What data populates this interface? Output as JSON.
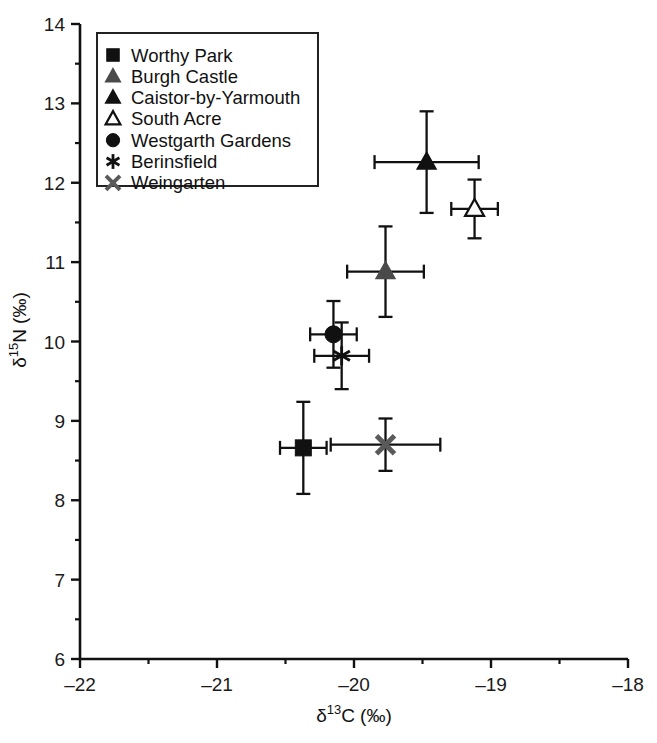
{
  "chart_data": {
    "type": "scatter",
    "title": "",
    "xlabel": "δ13C (‰)",
    "ylabel": "δ15N (‰)",
    "xlabel_parts": {
      "delta": "δ",
      "sup": "13",
      "element": "C",
      "units": "(‰)"
    },
    "ylabel_parts": {
      "delta": "δ",
      "sup": "15",
      "element": "N",
      "units": "(‰)"
    },
    "xlim": [
      -22,
      -18
    ],
    "ylim": [
      6,
      14
    ],
    "x_ticks": [
      -22,
      -21,
      -20,
      -19,
      -18
    ],
    "x_tick_labels": [
      "–22",
      "–21",
      "–20",
      "–19",
      "–18"
    ],
    "y_ticks": [
      6,
      7,
      8,
      9,
      10,
      11,
      12,
      13,
      14
    ],
    "y_tick_labels": [
      "6",
      "7",
      "8",
      "9",
      "10",
      "11",
      "12",
      "13",
      "14"
    ],
    "x_minor_step": 0.5,
    "y_minor_step": 0.5,
    "grid": false,
    "legend_position": "top-left",
    "error_bars": "both",
    "series": [
      {
        "name": "Worthy Park",
        "marker": "square",
        "fill": "#111111",
        "x": -20.37,
        "y": 8.66,
        "xerr": 0.17,
        "yerr": 0.58
      },
      {
        "name": "Burgh Castle",
        "marker": "triangle",
        "fill": "#4a4a4a",
        "x": -19.77,
        "y": 10.88,
        "xerr": 0.28,
        "yerr": 0.57
      },
      {
        "name": "Caistor-by-Yarmouth",
        "marker": "triangle",
        "fill": "#111111",
        "x": -19.47,
        "y": 12.26,
        "xerr": 0.38,
        "yerr": 0.64
      },
      {
        "name": "South Acre",
        "marker": "triangle-open",
        "fill": "#ffffff",
        "x": -19.12,
        "y": 11.67,
        "xerr": 0.17,
        "yerr": 0.37
      },
      {
        "name": "Westgarth Gardens",
        "marker": "circle",
        "fill": "#111111",
        "x": -20.15,
        "y": 10.09,
        "xerr": 0.17,
        "yerr": 0.42
      },
      {
        "name": "Berinsfield",
        "marker": "asterisk",
        "fill": "#111111",
        "x": -20.09,
        "y": 9.82,
        "xerr": 0.2,
        "yerr": 0.42
      },
      {
        "name": "Weingarten",
        "marker": "x-cross",
        "fill": "#5a5a5a",
        "x": -19.77,
        "y": 8.7,
        "xerr": 0.4,
        "yerr": 0.33
      }
    ]
  },
  "legend": {
    "items": [
      {
        "label": "Worthy Park"
      },
      {
        "label": "Burgh Castle"
      },
      {
        "label": "Caistor-by-Yarmouth"
      },
      {
        "label": "South Acre"
      },
      {
        "label": "Westgarth Gardens"
      },
      {
        "label": "Berinsfield"
      },
      {
        "label": "Weingarten"
      }
    ]
  },
  "colors": {
    "axis": "#111111",
    "marker_dark": "#111111",
    "marker_gray": "#4a4a4a",
    "background": "#ffffff"
  }
}
